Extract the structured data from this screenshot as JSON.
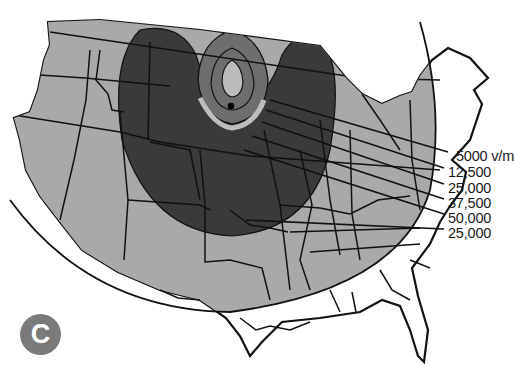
{
  "figure": {
    "badge_letter": "C",
    "unit_suffix": "v/m",
    "contour_labels": [
      {
        "value": "5000 v/m"
      },
      {
        "value": "12,500"
      },
      {
        "value": "25,000"
      },
      {
        "value": "37,500"
      },
      {
        "value": "50,000"
      },
      {
        "value": "25,000"
      }
    ],
    "ground_zero_marker": "burst point",
    "colors": {
      "outer_footprint": "#a9a9a9",
      "high_field_lobes": "#3a3a3a",
      "mid_ring": "#6e6e6e",
      "inner_ring": "#bcbcbc",
      "state_lines": "#111111",
      "background": "#ffffff"
    }
  }
}
